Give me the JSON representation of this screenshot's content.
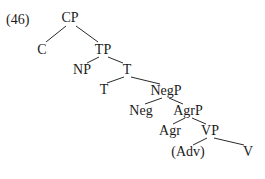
{
  "example_number": "(46)",
  "tree": {
    "nodes": [
      {
        "id": "CP",
        "label": "CP",
        "x": 70,
        "y": 18
      },
      {
        "id": "C",
        "label": "C",
        "x": 42,
        "y": 50
      },
      {
        "id": "TP",
        "label": "TP",
        "x": 103,
        "y": 50
      },
      {
        "id": "NP",
        "label": "NP",
        "x": 82,
        "y": 70
      },
      {
        "id": "Tbar",
        "label": "T",
        "x": 127,
        "y": 70
      },
      {
        "id": "T",
        "label": "T",
        "x": 104,
        "y": 90
      },
      {
        "id": "NegP",
        "label": "NegP",
        "x": 166,
        "y": 91
      },
      {
        "id": "Neg",
        "label": "Neg",
        "x": 141,
        "y": 111
      },
      {
        "id": "AgrP",
        "label": "AgrP",
        "x": 188,
        "y": 111
      },
      {
        "id": "Agr",
        "label": "Agr",
        "x": 170,
        "y": 131
      },
      {
        "id": "VP",
        "label": "VP",
        "x": 210,
        "y": 131
      },
      {
        "id": "Adv",
        "label": "(Adv)",
        "x": 188,
        "y": 152
      },
      {
        "id": "V",
        "label": "V",
        "x": 248,
        "y": 152
      }
    ],
    "edges": [
      [
        "CP",
        "C"
      ],
      [
        "CP",
        "TP"
      ],
      [
        "TP",
        "NP"
      ],
      [
        "TP",
        "Tbar"
      ],
      [
        "Tbar",
        "T"
      ],
      [
        "Tbar",
        "NegP"
      ],
      [
        "NegP",
        "Neg"
      ],
      [
        "NegP",
        "AgrP"
      ],
      [
        "AgrP",
        "Agr"
      ],
      [
        "AgrP",
        "VP"
      ],
      [
        "VP",
        "Adv"
      ],
      [
        "VP",
        "V"
      ]
    ]
  }
}
